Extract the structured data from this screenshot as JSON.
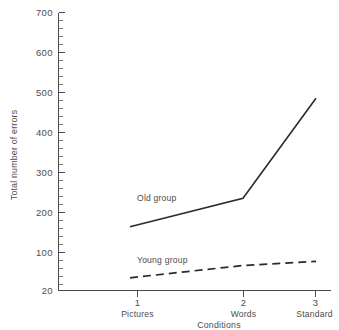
{
  "chart_data": {
    "type": "line",
    "title": "",
    "subtitle": "",
    "xlabel": "Conditions",
    "ylabel": "Total number of errors",
    "x": [
      1,
      2,
      3
    ],
    "categories": [
      "Pictures",
      "Words",
      "Standard"
    ],
    "xtick_numbers": [
      "1",
      "2",
      "3"
    ],
    "xtick_names": [
      "Pictures",
      "Words",
      "Standard"
    ],
    "xlim": [
      0.55,
      3.3
    ],
    "ylim": [
      20,
      700
    ],
    "ytick_labels": [
      "20",
      "100",
      "200",
      "300",
      "400",
      "500",
      "600",
      "700"
    ],
    "ytick_values": [
      20,
      100,
      200,
      300,
      400,
      500,
      600,
      700
    ],
    "yminor_step": 20,
    "grid": "off",
    "legend": "inline-annotations",
    "series": [
      {
        "name": "Old group",
        "style": "solid",
        "color": "#2b2b2b",
        "values": [
          175,
          245,
          490
        ],
        "label_x": 1.33,
        "label_y": 225
      },
      {
        "name": "Young group",
        "style": "dashed",
        "color": "#2b2b2b",
        "values": [
          50,
          80,
          90
        ],
        "label_x": 1.33,
        "label_y": 128
      }
    ],
    "annotations": [
      {
        "text": "Old group",
        "x": 1.33,
        "y": 225
      },
      {
        "text": "Young group",
        "x": 1.33,
        "y": 128
      }
    ]
  },
  "axes": {
    "y_axis_title": "Total number of errors",
    "x_axis_title": "Conditions"
  }
}
